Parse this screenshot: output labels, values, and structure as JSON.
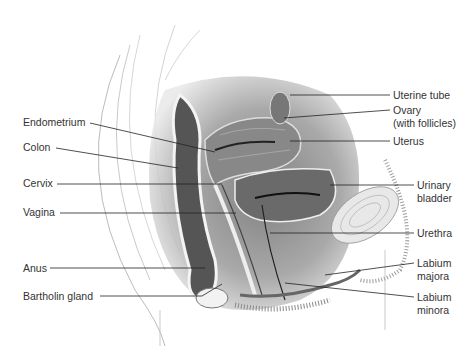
{
  "diagram": {
    "labels_left": [
      {
        "id": "endometrium",
        "text": "Endometrium"
      },
      {
        "id": "colon",
        "text": "Colon"
      },
      {
        "id": "cervix",
        "text": "Cervix"
      },
      {
        "id": "vagina",
        "text": "Vagina"
      },
      {
        "id": "anus",
        "text": "Anus"
      },
      {
        "id": "bartholin",
        "text": "Bartholin gland"
      }
    ],
    "labels_right": [
      {
        "id": "uterine_tube",
        "text": "Uterine tube"
      },
      {
        "id": "ovary",
        "line1": "Ovary",
        "line2": "(with follicles)"
      },
      {
        "id": "uterus",
        "text": "Uterus"
      },
      {
        "id": "bladder",
        "line1": "Urinary",
        "line2": "bladder"
      },
      {
        "id": "urethra",
        "text": "Urethra"
      },
      {
        "id": "labium_majora",
        "line1": "Labium",
        "line2": "majora"
      },
      {
        "id": "labium_minora",
        "line1": "Labium",
        "line2": "minora"
      }
    ]
  }
}
